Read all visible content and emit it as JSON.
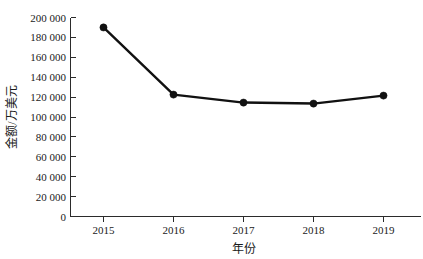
{
  "chart_data": {
    "type": "line",
    "title": "",
    "subtitle": "",
    "xlabel": "年份",
    "ylabel": "金额/万美元",
    "categories": [
      "2015",
      "2016",
      "2017",
      "2018",
      "2019"
    ],
    "series": [
      {
        "name": "金额",
        "values": [
          190000,
          122500,
          114500,
          113500,
          121500
        ]
      }
    ],
    "ylim": [
      0,
      200000
    ],
    "yticks": [
      0,
      20000,
      40000,
      60000,
      80000,
      100000,
      120000,
      140000,
      160000,
      180000,
      200000
    ],
    "ytick_labels": [
      "0",
      "20 000",
      "40 000",
      "60 000",
      "80 000",
      "100 000",
      "120 000",
      "140 000",
      "160 000",
      "180 000",
      "200 000"
    ],
    "xtick_labels": [
      "2015",
      "2016",
      "2017",
      "2018",
      "2019"
    ],
    "grid": false,
    "legend": false,
    "legend_position": "none",
    "marker": "circle",
    "line_color": "#111111",
    "marker_color": "#111111",
    "axis_color": "#2b2b2b",
    "background_color": "#ffffff"
  },
  "axis": {
    "y_title": "金额/万美元",
    "x_title": "年份"
  },
  "ticks": {
    "y": {
      "t0": "0",
      "t1": "20 000",
      "t2": "40 000",
      "t3": "60 000",
      "t4": "80 000",
      "t5": "100 000",
      "t6": "120 000",
      "t7": "140 000",
      "t8": "160 000",
      "t9": "180 000",
      "t10": "200 000"
    },
    "x": {
      "t0": "2015",
      "t1": "2016",
      "t2": "2017",
      "t3": "2018",
      "t4": "2019"
    }
  }
}
